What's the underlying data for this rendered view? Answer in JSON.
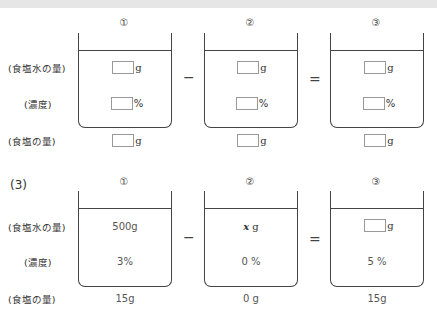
{
  "row_labels": {
    "salt_water_amount": "(食塩水の量)",
    "concentration": "(濃度)",
    "salt_amount": "(食塩の量)"
  },
  "operators": {
    "minus": "−",
    "equals": "="
  },
  "section_top": {
    "beakers": [
      {
        "number": "①",
        "salt_water_unit": "g",
        "concentration_unit": "%",
        "salt_unit": "g"
      },
      {
        "number": "②",
        "salt_water_unit": "g",
        "concentration_unit": "%",
        "salt_unit": "g"
      },
      {
        "number": "③",
        "salt_water_unit": "g",
        "concentration_unit": "%",
        "salt_unit": "g"
      }
    ]
  },
  "section_3": {
    "part_label": "(3)",
    "beakers": [
      {
        "number": "①",
        "salt_water": "500g",
        "concentration": "3%",
        "salt": "15g"
      },
      {
        "number": "②",
        "salt_water_var": "x",
        "salt_water_unit": "g",
        "concentration": "0 %",
        "salt": "0 g"
      },
      {
        "number": "③",
        "salt_water_unit": "g",
        "concentration": "5 %",
        "salt": "15g"
      }
    ]
  }
}
